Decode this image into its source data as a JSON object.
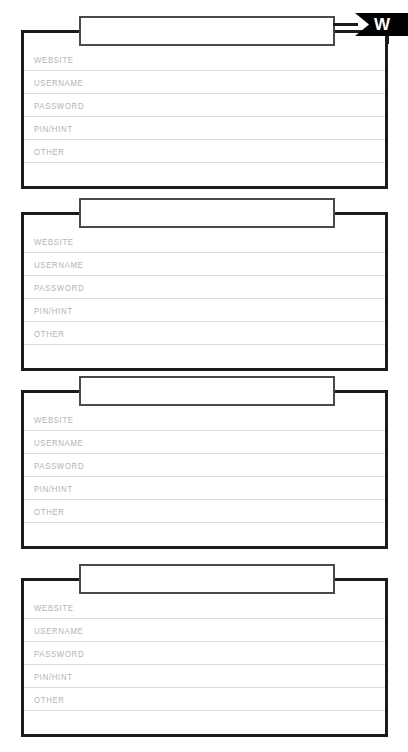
{
  "page": {
    "kind": "password-log-sheet",
    "background_color": "#ffffff",
    "width": 408,
    "height": 752
  },
  "index_tab": {
    "letter": "W",
    "icon": "bookmark-tab-icon",
    "background_color": "#000000",
    "text_color": "#ffffff"
  },
  "field_labels": {
    "website": "WEBSITE",
    "username": "USERNAME",
    "password": "PASSWORD",
    "pin_hint": "PIN/HINT",
    "other": "OTHER",
    "blank": ""
  },
  "colors": {
    "card_border": "#1b1b1b",
    "title_box_border": "#4a4a4a",
    "rule_line": "#dcdcdc",
    "label_text": "#b3b3b3"
  },
  "cards": [
    {
      "id": "entry-1",
      "title": "",
      "title_placeholder": "",
      "has_index_tab": true,
      "fields": [
        {
          "label": "WEBSITE",
          "value": ""
        },
        {
          "label": "USERNAME",
          "value": ""
        },
        {
          "label": "PASSWORD",
          "value": ""
        },
        {
          "label": "PIN/HINT",
          "value": ""
        },
        {
          "label": "OTHER",
          "value": ""
        },
        {
          "label": "",
          "value": ""
        }
      ]
    },
    {
      "id": "entry-2",
      "title": "",
      "title_placeholder": "",
      "has_index_tab": false,
      "fields": [
        {
          "label": "WEBSITE",
          "value": ""
        },
        {
          "label": "USERNAME",
          "value": ""
        },
        {
          "label": "PASSWORD",
          "value": ""
        },
        {
          "label": "PIN/HINT",
          "value": ""
        },
        {
          "label": "OTHER",
          "value": ""
        },
        {
          "label": "",
          "value": ""
        }
      ]
    },
    {
      "id": "entry-3",
      "title": "",
      "title_placeholder": "",
      "has_index_tab": false,
      "fields": [
        {
          "label": "WEBSITE",
          "value": ""
        },
        {
          "label": "USERNAME",
          "value": ""
        },
        {
          "label": "PASSWORD",
          "value": ""
        },
        {
          "label": "PIN/HINT",
          "value": ""
        },
        {
          "label": "OTHER",
          "value": ""
        },
        {
          "label": "",
          "value": ""
        }
      ]
    },
    {
      "id": "entry-4",
      "title": "",
      "title_placeholder": "",
      "has_index_tab": false,
      "fields": [
        {
          "label": "WEBSITE",
          "value": ""
        },
        {
          "label": "USERNAME",
          "value": ""
        },
        {
          "label": "PASSWORD",
          "value": ""
        },
        {
          "label": "PIN/HINT",
          "value": ""
        },
        {
          "label": "OTHER",
          "value": ""
        },
        {
          "label": "",
          "value": ""
        }
      ]
    }
  ]
}
